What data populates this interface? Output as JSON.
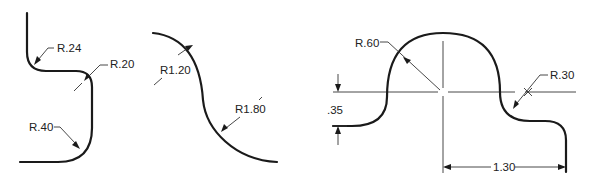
{
  "figures": [
    {
      "id": "fig-left",
      "labels": {
        "r1": "R.24",
        "r2": "R.20",
        "r3": "R.40"
      }
    },
    {
      "id": "fig-middle",
      "labels": {
        "r1": "R1.20",
        "r2": "R1.80"
      }
    },
    {
      "id": "fig-right",
      "labels": {
        "r1": "R.60",
        "r2": "R.30",
        "height_dim": ".35",
        "width_dim": "1.30"
      }
    }
  ],
  "colors": {
    "line": "#1a1a1a",
    "background": "#ffffff"
  }
}
